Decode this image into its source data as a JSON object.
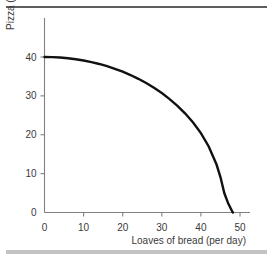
{
  "chart_data": {
    "type": "line",
    "title": "",
    "subtitle": "",
    "xlabel": "Loaves of bread (per day)",
    "ylabel": "Pizza (per day)",
    "xlim": [
      0,
      53
    ],
    "ylim": [
      0,
      44
    ],
    "xticks": [
      0,
      10,
      20,
      30,
      40,
      50
    ],
    "xtick_labels": [
      "0",
      "10",
      "20",
      "30",
      "40",
      "50"
    ],
    "yticks": [
      0,
      10,
      20,
      30,
      40
    ],
    "ytick_labels": [
      "0",
      "10",
      "20",
      "30",
      "40"
    ],
    "grid": false,
    "legend": null,
    "annotations": [],
    "series": [
      {
        "name": "Production possibilities frontier",
        "color": "#111111",
        "x": [
          0,
          2,
          4,
          6,
          8,
          10,
          12,
          14,
          16,
          18,
          20,
          22,
          24,
          26,
          28,
          30,
          32,
          34,
          36,
          38,
          40,
          42,
          44,
          45,
          46,
          47,
          47.6,
          48,
          48.2
        ],
        "y": [
          40.0,
          39.96,
          39.86,
          39.68,
          39.43,
          39.1,
          38.69,
          38.21,
          37.63,
          36.97,
          36.22,
          35.36,
          34.39,
          33.31,
          32.09,
          30.72,
          29.18,
          27.44,
          25.46,
          23.15,
          20.41,
          16.99,
          12.34,
          9.11,
          4.94,
          2.3,
          1.1,
          0.3,
          0.0
        ]
      }
    ],
    "colors": {
      "curve": "#111111",
      "axis": "#808080",
      "text": "#3a3a3a",
      "rule_top": "#5e5e5e",
      "rule_bottom": "#c3c3c3",
      "background": "#ffffff"
    }
  }
}
